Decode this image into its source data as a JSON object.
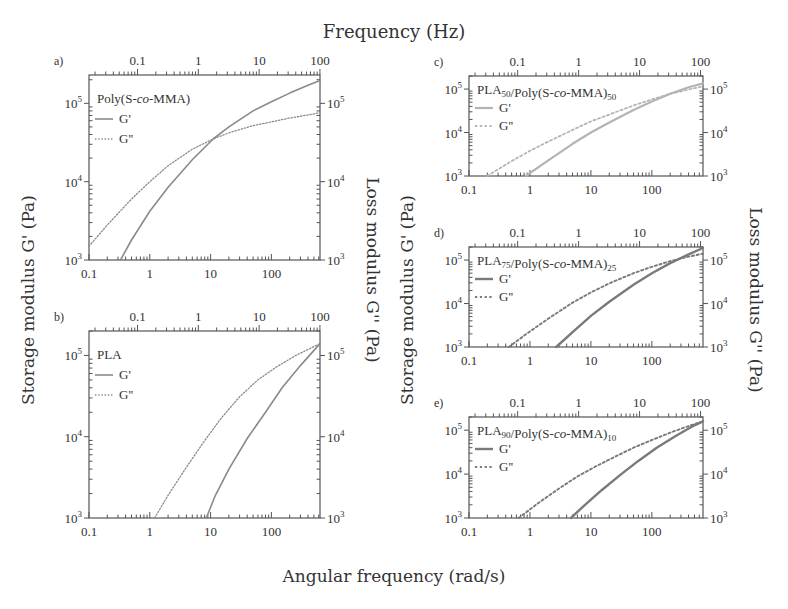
{
  "figure": {
    "top_axis_title": "Frequency (Hz)",
    "bottom_axis_title": "Angular frequency (rad/s)",
    "left_axis_title": "Storage modulus G' (Pa)",
    "right_axis_title": "Loss modulus G'' (Pa)",
    "colors": {
      "axis": "#555555",
      "text": "#333333",
      "series_medium": "#8a8a8a",
      "series_light": "#b4b4b4",
      "series_dark": "#7a7a7a"
    }
  },
  "chart_data": [
    {
      "panel": "a)",
      "type": "line",
      "title": "Poly(S-co-MMA)",
      "title_parts": [
        {
          "t": "Poly(S-"
        },
        {
          "t": "co",
          "i": true
        },
        {
          "t": "-MMA)"
        }
      ],
      "xlabel": "Angular frequency (rad/s)",
      "x2label": "Frequency (Hz)",
      "ylabel": "Storage modulus G' (Pa)",
      "y2label": "Loss modulus G'' (Pa)",
      "xscale": "log",
      "yscale": "log",
      "xlim": [
        0.1,
        630
      ],
      "ylim": [
        1000,
        230000
      ],
      "xticks": [
        0.1,
        1,
        10,
        100
      ],
      "xtick_labels": [
        "0.1",
        "1",
        "10",
        "100"
      ],
      "x2ticks_hz": [
        0.1,
        1,
        10,
        100
      ],
      "x2tick_labels": [
        "0.1",
        "1",
        "10",
        "100"
      ],
      "yticks": [
        1000,
        10000,
        100000
      ],
      "ytick_labels": [
        "10^3",
        "10^4",
        "10^5"
      ],
      "legend": [
        "G'",
        "G''"
      ],
      "color": "#8a8a8a",
      "linewidth": 1.6,
      "series": [
        {
          "name": "G'",
          "style": "solid",
          "x": [
            0.33,
            0.5,
            1,
            2,
            5,
            11,
            20,
            50,
            100,
            200,
            400,
            630
          ],
          "y": [
            1000,
            1800,
            4200,
            8500,
            19000,
            35000,
            50000,
            80000,
            105000,
            135000,
            170000,
            195000
          ]
        },
        {
          "name": "G''",
          "style": "dotted",
          "x": [
            0.1,
            0.2,
            0.5,
            1,
            2,
            5,
            11,
            20,
            50,
            100,
            200,
            400,
            630
          ],
          "y": [
            1500,
            2800,
            6000,
            10000,
            16000,
            26000,
            35000,
            42000,
            52000,
            58000,
            65000,
            71000,
            76000
          ]
        }
      ]
    },
    {
      "panel": "b)",
      "type": "line",
      "title": "PLA",
      "title_parts": [
        {
          "t": "PLA"
        }
      ],
      "xlabel": "Angular frequency (rad/s)",
      "x2label": "Frequency (Hz)",
      "ylabel": "Storage modulus G' (Pa)",
      "y2label": "Loss modulus G'' (Pa)",
      "xscale": "log",
      "yscale": "log",
      "xlim": [
        0.1,
        630
      ],
      "ylim": [
        1000,
        200000
      ],
      "xticks": [
        0.1,
        1,
        10,
        100
      ],
      "xtick_labels": [
        "0.1",
        "1",
        "10",
        "100"
      ],
      "x2ticks_hz": [
        0.1,
        1,
        10,
        100
      ],
      "x2tick_labels": [
        "0.1",
        "1",
        "10",
        "100"
      ],
      "yticks": [
        1000,
        10000,
        100000
      ],
      "ytick_labels": [
        "10^3",
        "10^4",
        "10^5"
      ],
      "legend": [
        "G'",
        "G''"
      ],
      "color": "#8a8a8a",
      "linewidth": 1.6,
      "series": [
        {
          "name": "G'",
          "style": "solid",
          "x": [
            8.5,
            12,
            20,
            40,
            80,
            150,
            300,
            630
          ],
          "y": [
            1000,
            1900,
            4000,
            9500,
            20000,
            40000,
            75000,
            140000
          ]
        },
        {
          "name": "G''",
          "style": "dotted",
          "x": [
            1.2,
            2,
            4,
            8,
            15,
            30,
            60,
            120,
            250,
            630
          ],
          "y": [
            1000,
            1900,
            4200,
            9000,
            17000,
            31000,
            50000,
            72000,
            100000,
            140000
          ]
        }
      ]
    },
    {
      "panel": "c)",
      "type": "line",
      "title": "PLA50/Poly(S-co-MMA)50",
      "title_parts": [
        {
          "t": "PLA"
        },
        {
          "t": "50",
          "sub": true
        },
        {
          "t": "/Poly(S-"
        },
        {
          "t": "co",
          "i": true
        },
        {
          "t": "-MMA)"
        },
        {
          "t": "50",
          "sub": true
        }
      ],
      "xlabel": "Angular frequency (rad/s)",
      "x2label": "Frequency (Hz)",
      "ylabel": "Storage modulus G' (Pa)",
      "y2label": "Loss modulus G'' (Pa)",
      "xscale": "log",
      "yscale": "log",
      "xlim": [
        0.1,
        690
      ],
      "ylim": [
        1000,
        200000
      ],
      "xticks": [
        0.1,
        1,
        10,
        100
      ],
      "xtick_labels": [
        "0.1",
        "1",
        "10",
        "100"
      ],
      "x2ticks_hz": [
        0.1,
        1,
        10,
        100
      ],
      "x2tick_labels": [
        "0.1",
        "1",
        "10",
        "100"
      ],
      "yticks": [
        1000,
        10000,
        100000
      ],
      "ytick_labels": [
        "10^3",
        "10^4",
        "10^5"
      ],
      "legend": [
        "G'",
        "G''"
      ],
      "color": "#b4b4b4",
      "linewidth": 2.2,
      "series": [
        {
          "name": "G'",
          "style": "solid",
          "x": [
            0.85,
            2,
            5,
            10,
            20,
            50,
            100,
            200,
            400,
            690
          ],
          "y": [
            1000,
            2300,
            5500,
            10000,
            17000,
            33000,
            52000,
            78000,
            110000,
            135000
          ]
        },
        {
          "name": "G''",
          "style": "dotted",
          "x": [
            0.2,
            0.5,
            1,
            2,
            5,
            10,
            20,
            50,
            100,
            200,
            400,
            690
          ],
          "y": [
            1000,
            2200,
            3800,
            6200,
            11500,
            18000,
            26000,
            42000,
            58000,
            78000,
            98000,
            115000
          ]
        }
      ]
    },
    {
      "panel": "d)",
      "type": "line",
      "title": "PLA75/Poly(S-co-MMA)25",
      "title_parts": [
        {
          "t": "PLA"
        },
        {
          "t": "75",
          "sub": true
        },
        {
          "t": "/Poly(S-"
        },
        {
          "t": "co",
          "i": true
        },
        {
          "t": "-MMA)"
        },
        {
          "t": "25",
          "sub": true
        }
      ],
      "xlabel": "Angular frequency (rad/s)",
      "x2label": "Frequency (Hz)",
      "ylabel": "Storage modulus G' (Pa)",
      "y2label": "Loss modulus G'' (Pa)",
      "xscale": "log",
      "yscale": "log",
      "xlim": [
        0.1,
        690
      ],
      "ylim": [
        1000,
        200000
      ],
      "xticks": [
        0.1,
        1,
        10,
        100
      ],
      "xtick_labels": [
        "0.1",
        "1",
        "10",
        "100"
      ],
      "x2ticks_hz": [
        0.1,
        1,
        10,
        100
      ],
      "x2tick_labels": [
        "0.1",
        "1",
        "10",
        "100"
      ],
      "yticks": [
        1000,
        10000,
        100000
      ],
      "ytick_labels": [
        "10^3",
        "10^4",
        "10^5"
      ],
      "legend": [
        "G'",
        "G''"
      ],
      "color": "#7a7a7a",
      "linewidth": 2.4,
      "series": [
        {
          "name": "G'",
          "style": "solid",
          "x": [
            2.7,
            5,
            10,
            20,
            50,
            100,
            200,
            400,
            690
          ],
          "y": [
            1000,
            2200,
            5200,
            11000,
            27000,
            50000,
            85000,
            135000,
            190000
          ]
        },
        {
          "name": "G''",
          "style": "dotted",
          "x": [
            0.45,
            1,
            2,
            5,
            10,
            20,
            50,
            100,
            200,
            400,
            690
          ],
          "y": [
            1000,
            2300,
            4500,
            10500,
            18000,
            29000,
            50000,
            70000,
            95000,
            120000,
            140000
          ]
        }
      ]
    },
    {
      "panel": "e)",
      "type": "line",
      "title": "PLA90/Poly(S-co-MMA)10",
      "title_parts": [
        {
          "t": "PLA"
        },
        {
          "t": "90",
          "sub": true
        },
        {
          "t": "/Poly(S-"
        },
        {
          "t": "co",
          "i": true
        },
        {
          "t": "-MMA)"
        },
        {
          "t": "10",
          "sub": true
        }
      ],
      "xlabel": "Angular frequency (rad/s)",
      "x2label": "Frequency (Hz)",
      "ylabel": "Storage modulus G' (Pa)",
      "y2label": "Loss modulus G'' (Pa)",
      "xscale": "log",
      "yscale": "log",
      "xlim": [
        0.1,
        690
      ],
      "ylim": [
        1000,
        200000
      ],
      "xticks": [
        0.1,
        1,
        10,
        100
      ],
      "xtick_labels": [
        "0.1",
        "1",
        "10",
        "100"
      ],
      "x2ticks_hz": [
        0.1,
        1,
        10,
        100
      ],
      "x2tick_labels": [
        "0.1",
        "1",
        "10",
        "100"
      ],
      "yticks": [
        1000,
        10000,
        100000
      ],
      "ytick_labels": [
        "10^3",
        "10^4",
        "10^5"
      ],
      "legend": [
        "G'",
        "G''"
      ],
      "color": "#7a7a7a",
      "linewidth": 2.4,
      "series": [
        {
          "name": "G'",
          "style": "solid",
          "x": [
            4.7,
            8,
            15,
            30,
            60,
            120,
            250,
            450,
            690
          ],
          "y": [
            1000,
            2000,
            4300,
            9500,
            20000,
            40000,
            75000,
            120000,
            160000
          ]
        },
        {
          "name": "G''",
          "style": "dotted",
          "x": [
            0.65,
            1.5,
            3,
            6,
            12,
            25,
            50,
            100,
            200,
            400,
            690
          ],
          "y": [
            1000,
            2400,
            4700,
            8800,
            15000,
            25000,
            40000,
            60000,
            88000,
            125000,
            160000
          ]
        }
      ]
    }
  ],
  "layout_panels": [
    {
      "x0": 89,
      "x1": 320,
      "ytop": 75,
      "ybot": 260
    },
    {
      "x0": 89,
      "x1": 320,
      "ytop": 331,
      "ybot": 518
    },
    {
      "x0": 469,
      "x1": 703,
      "ytop": 76,
      "ybot": 176
    },
    {
      "x0": 469,
      "x1": 703,
      "ytop": 247,
      "ybot": 347
    },
    {
      "x0": 469,
      "x1": 703,
      "ytop": 417,
      "ybot": 518
    }
  ]
}
